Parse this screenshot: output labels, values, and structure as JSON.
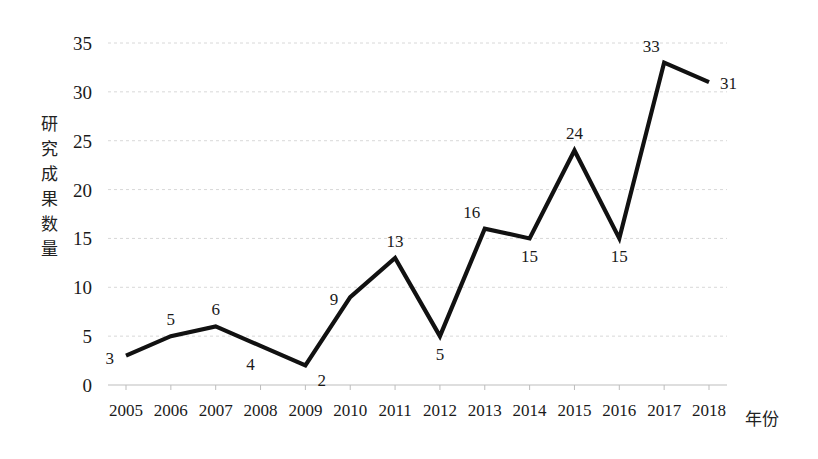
{
  "chart_data": {
    "type": "line",
    "title": "",
    "xlabel": "年份",
    "ylabel": "研究成果数量",
    "ylabel_chars": [
      "研",
      "究",
      "成",
      "果",
      "数",
      "量"
    ],
    "categories": [
      "2005",
      "2006",
      "2007",
      "2008",
      "2009",
      "2010",
      "2011",
      "2012",
      "2013",
      "2014",
      "2015",
      "2016",
      "2017",
      "2018"
    ],
    "values": [
      3,
      5,
      6,
      4,
      2,
      9,
      13,
      5,
      16,
      15,
      24,
      15,
      33,
      31
    ],
    "point_labels": [
      "3",
      "5",
      "6",
      "4",
      "2",
      "9",
      "13",
      "5",
      "16",
      "15",
      "24",
      "15",
      "33",
      "31"
    ],
    "label_positions": [
      "left",
      "above",
      "above",
      "below-left",
      "below-right",
      "left",
      "above",
      "below",
      "above-left",
      "below",
      "above",
      "below",
      "above-left",
      "right"
    ],
    "ylim": [
      0,
      35
    ],
    "yticks": [
      0,
      5,
      10,
      15,
      20,
      25,
      30,
      35
    ],
    "ytick_labels": [
      "0",
      "5",
      "10",
      "15",
      "20",
      "25",
      "30",
      "35"
    ],
    "grid": true,
    "grid_style": "dotted",
    "legend": "none",
    "series_color": "#111111",
    "grid_color": "#d8d8d8",
    "background": "#ffffff"
  }
}
